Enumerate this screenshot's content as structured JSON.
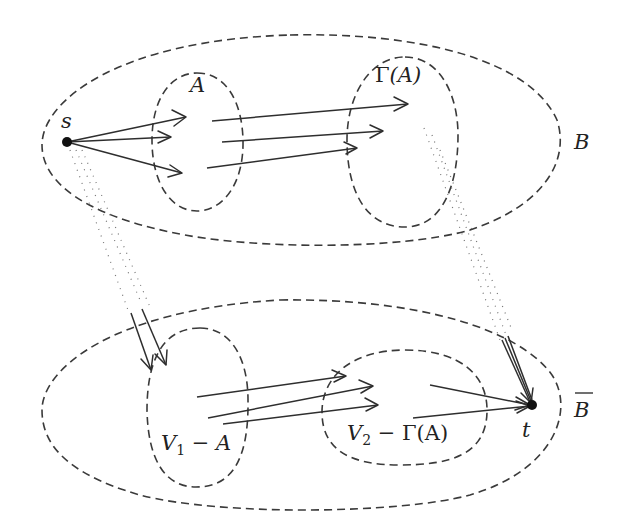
{
  "diagram": {
    "title": "",
    "regions": {
      "B": {
        "label": "B",
        "overline": false
      },
      "B_bar": {
        "label": "B",
        "overline": true
      },
      "A": {
        "label": "A"
      },
      "gamma_A": {
        "label_gamma": "Γ",
        "label_rest": "(A)"
      },
      "V1_minus_A": {
        "label_v": "V",
        "label_sub": "1",
        "label_rest": " − A"
      },
      "V2_minus_gamma_A": {
        "label_v": "V",
        "label_sub": "2",
        "label_rest": " − Γ(A)"
      }
    },
    "nodes": {
      "s": {
        "label": "s"
      },
      "t": {
        "label": "t"
      }
    },
    "edges": [
      {
        "from": "s",
        "to": "A",
        "count": 3,
        "style": "solid-arrow"
      },
      {
        "from": "A",
        "to": "Γ(A)",
        "count": 3,
        "style": "solid-arrow"
      },
      {
        "from": "s",
        "to": "V1 − A",
        "count": 2,
        "style": "dotted-then-arrow"
      },
      {
        "from": "V1 − A",
        "to": "V2 − Γ(A)",
        "count": 3,
        "style": "solid-arrow"
      },
      {
        "from": "V2 − Γ(A)",
        "to": "t",
        "count": 2,
        "style": "solid-arrow"
      },
      {
        "from": "Γ(A)",
        "to": "t",
        "count": 3,
        "style": "dotted-then-arrow"
      }
    ]
  }
}
